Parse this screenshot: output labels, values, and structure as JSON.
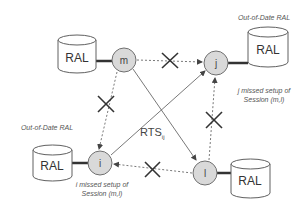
{
  "diagram": {
    "nodes": [
      {
        "id": "m",
        "label": "m"
      },
      {
        "id": "j",
        "label": "j"
      },
      {
        "id": "i",
        "label": "i"
      },
      {
        "id": "l",
        "label": "l"
      }
    ],
    "databases": [
      {
        "attached_to": "m",
        "label": "RAL"
      },
      {
        "attached_to": "j",
        "label": "RAL",
        "caption": "Out-of-Date RAL"
      },
      {
        "attached_to": "i",
        "label": "RAL",
        "caption": "Out-of-Date RAL"
      },
      {
        "attached_to": "l",
        "label": "RAL"
      }
    ],
    "notes": {
      "j_line1": "j missed setup of",
      "j_line2": "Session (m,l)",
      "i_line1": "i missed setup of",
      "i_line2": "Session (m,l)"
    },
    "rts": {
      "label": "RTS",
      "subscript": "ij"
    },
    "edges": [
      {
        "from": "m",
        "to": "j",
        "style": "dashed",
        "blocked": true
      },
      {
        "from": "m",
        "to": "i",
        "style": "dashed",
        "blocked": true
      },
      {
        "from": "l",
        "to": "j",
        "style": "dashed",
        "blocked": true
      },
      {
        "from": "l",
        "to": "i",
        "style": "dashed",
        "blocked": true
      },
      {
        "from": "m",
        "to": "l",
        "style": "solid",
        "blocked": false
      },
      {
        "from": "i",
        "to": "j",
        "style": "solid",
        "label": "RTS_ij",
        "blocked": false
      }
    ]
  }
}
